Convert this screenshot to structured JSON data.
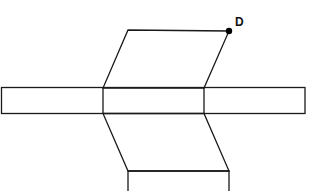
{
  "diagram": {
    "type": "net-of-parallelepiped",
    "point_label": "D",
    "colors": {
      "stroke": "#1a1a1a",
      "background": "#ffffff",
      "point": "#000000"
    },
    "shapes": {
      "top_parallelogram": [
        [
          128,
          30
        ],
        [
          229,
          31
        ],
        [
          204,
          88
        ],
        [
          103,
          88
        ]
      ],
      "horizontal_strip": {
        "x": 1,
        "y": 87,
        "width": 304,
        "height": 26,
        "dividers_x": [
          103,
          204
        ]
      },
      "lower_parallelogram": [
        [
          103,
          113
        ],
        [
          204,
          113
        ],
        [
          229,
          171
        ],
        [
          128,
          171
        ]
      ],
      "bottom_rectangle": {
        "x": 128,
        "y": 171,
        "width": 101,
        "height": 25
      }
    },
    "point_D": [
      229,
      31
    ]
  }
}
